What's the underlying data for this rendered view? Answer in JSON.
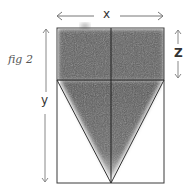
{
  "figure": {
    "caption": "fig 2",
    "labels": {
      "width": "x",
      "height": "y",
      "top_section": "Z"
    }
  },
  "geometry": {
    "rect": {
      "x": 57,
      "y": 28,
      "w": 107,
      "h": 155
    },
    "divider_y": 80,
    "center_x": 111,
    "triangle": [
      [
        57,
        80
      ],
      [
        111,
        183
      ],
      [
        164,
        80
      ]
    ]
  },
  "colors": {
    "line": "#333333",
    "shade": "#5a5a5a",
    "arrow": "#777777"
  }
}
